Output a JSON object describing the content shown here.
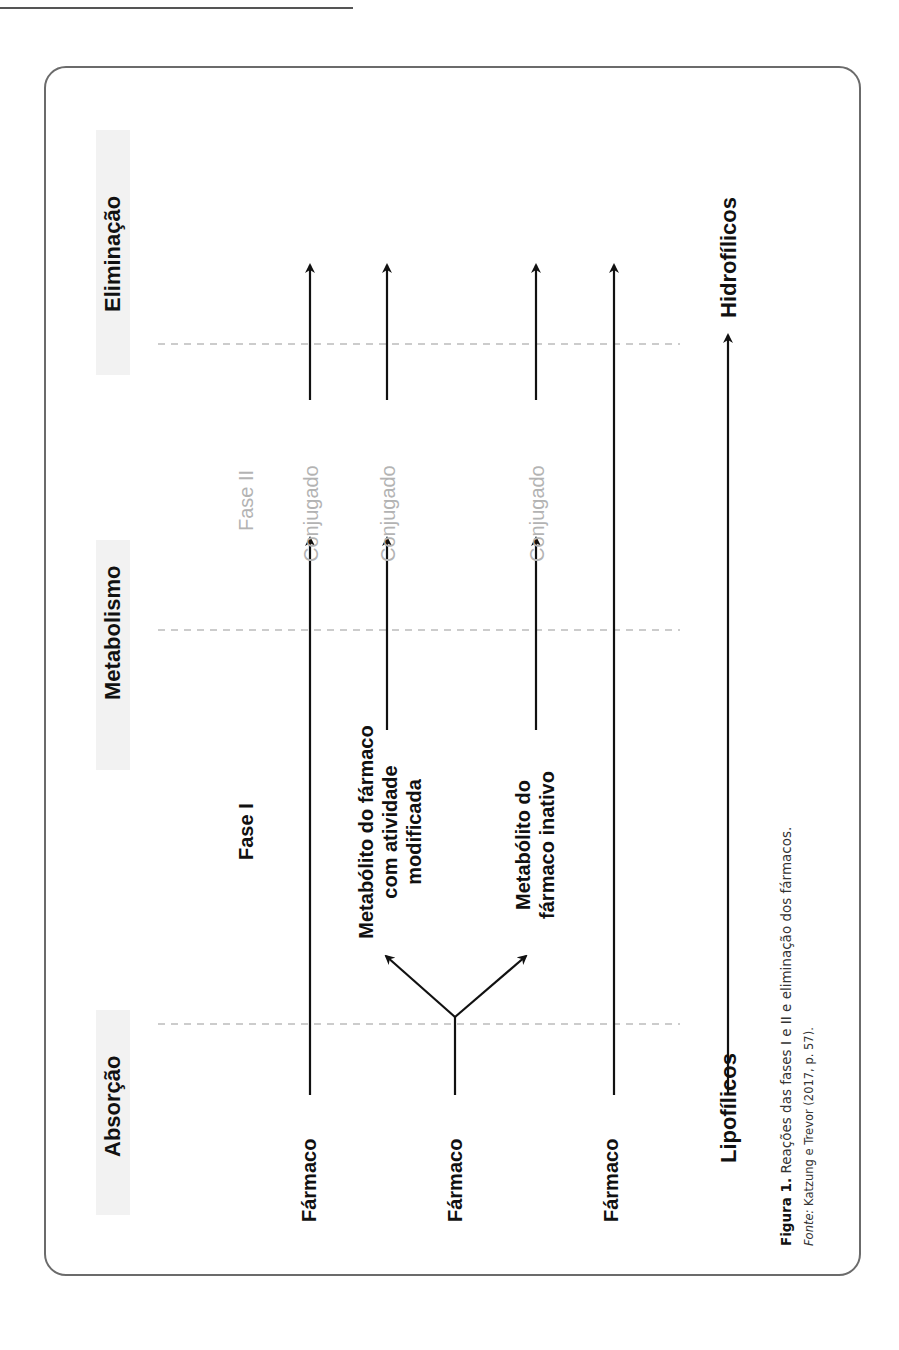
{
  "figure": {
    "headers": {
      "absorption": "Absorção",
      "metabolism": "Metabolismo",
      "elimination": "Eliminação"
    },
    "phases": {
      "phase1": "Fase I",
      "phase2": "Fase II"
    },
    "rows": [
      {
        "start": "Fármaco",
        "phase2": "Conjugado"
      },
      {
        "start": "Fármaco",
        "branch_active": [
          "Metabólito do fármaco",
          "com atividade",
          "modificada"
        ],
        "branch_inactive": [
          "Metabólito do",
          "fármaco inativo"
        ],
        "phase2_active": "Conjugado",
        "phase2_inactive": "Conjugado"
      },
      {
        "start": "Fármaco"
      }
    ],
    "gradient": {
      "from": "Lipofílicos",
      "to": "Hidrofílicos"
    }
  },
  "caption": {
    "label": "Figura 1.",
    "text": " Reações das fases I e II e eliminação dos fármacos.",
    "source_label": "Fonte:",
    "source_text": " Katzung e Trevor (2017, p. 57)."
  },
  "colors": {
    "ink": "#111111",
    "phase2_gray": "#b3b3b3",
    "frame": "#6b6b6b",
    "band": "#f2f2f2"
  }
}
